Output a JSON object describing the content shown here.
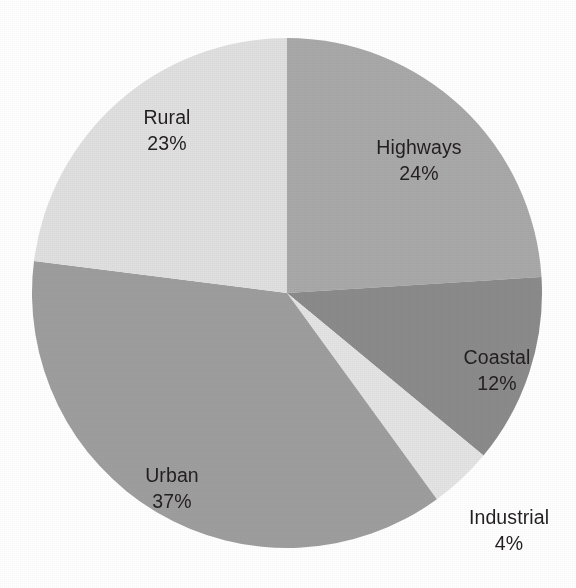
{
  "chart_data": {
    "type": "pie",
    "title": "",
    "subtitle": "",
    "xlabel": "",
    "ylabel": "",
    "legend_position": "none",
    "grid": false,
    "labels_inside": true,
    "value_unit": "%",
    "start_angle_deg": 0,
    "direction": "clockwise",
    "categories": [
      "Highways",
      "Coastal",
      "Industrial",
      "Urban",
      "Rural"
    ],
    "values": [
      24,
      12,
      4,
      37,
      23
    ],
    "colors": [
      "#a9a9a9",
      "#8b8b8b",
      "#e4e4e4",
      "#9e9e9e",
      "#e0e0e0"
    ],
    "slices": [
      {
        "name": "Highways",
        "value": 24,
        "value_text": "24%",
        "color": "#a9a9a9",
        "start_angle_deg": 0,
        "end_angle_deg": 86.4,
        "label_x": 419,
        "label_y": 135
      },
      {
        "name": "Coastal",
        "value": 12,
        "value_text": "12%",
        "color": "#8b8b8b",
        "start_angle_deg": 86.4,
        "end_angle_deg": 129.6,
        "label_x": 497,
        "label_y": 345
      },
      {
        "name": "Industrial",
        "value": 4,
        "value_text": "4%",
        "color": "#e4e4e4",
        "start_angle_deg": 129.6,
        "end_angle_deg": 144.0,
        "label_x": 509,
        "label_y": 505
      },
      {
        "name": "Urban",
        "value": 37,
        "value_text": "37%",
        "color": "#9e9e9e",
        "start_angle_deg": 144.0,
        "end_angle_deg": 277.2,
        "label_x": 172,
        "label_y": 463
      },
      {
        "name": "Rural",
        "value": 23,
        "value_text": "23%",
        "color": "#e0e0e0",
        "start_angle_deg": 277.2,
        "end_angle_deg": 360.0,
        "label_x": 167,
        "label_y": 105
      }
    ],
    "geometry": {
      "center_x": 287,
      "center_y": 293,
      "radius": 255
    },
    "background_color": "#ffffff",
    "total": 100
  }
}
